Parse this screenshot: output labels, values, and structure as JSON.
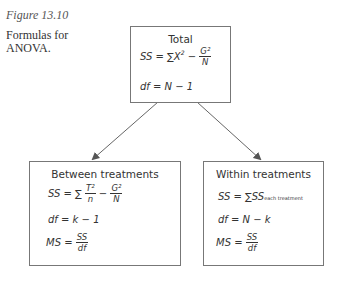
{
  "caption": {
    "figure": "Figure 13.10",
    "text": "Formulas for ANOVA."
  },
  "boxes": {
    "total": {
      "title": "Total",
      "ss": {
        "lhs": "SS",
        "eq": "=",
        "sum": "∑X",
        "sup": "2",
        "minus": "−",
        "num": "G²",
        "den": "N"
      },
      "df": "df = N − 1"
    },
    "between": {
      "title": "Between treatments",
      "ss": {
        "lhs": "SS",
        "eq": "=",
        "sum": "∑",
        "num1": "T²",
        "den1": "n",
        "minus": "−",
        "num2": "G²",
        "den2": "N"
      },
      "df": "df = k − 1",
      "ms": {
        "lhs": "MS =",
        "num": "SS",
        "den": "df"
      }
    },
    "within": {
      "title": "Within treatments",
      "ss": {
        "lhs": "SS = ∑SS",
        "sub": "each treatment"
      },
      "df": "df = N − k",
      "ms": {
        "lhs": "MS =",
        "num": "SS",
        "den": "df"
      }
    }
  }
}
